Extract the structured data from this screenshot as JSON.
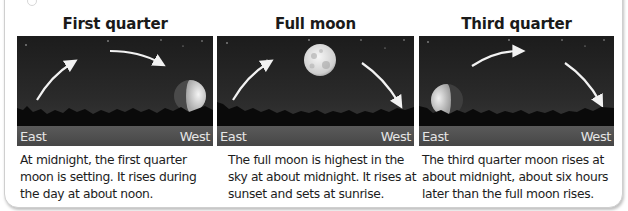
{
  "panels": [
    {
      "title": "First quarter",
      "east_label": "East",
      "west_label": "West",
      "moon_phase": "first-quarter",
      "moon_position": "setting-west",
      "caption": "At midnight, the first quarter moon is setting.  It rises during the day at about noon."
    },
    {
      "title": "Full moon",
      "east_label": "East",
      "west_label": "West",
      "moon_phase": "full",
      "moon_position": "highest-overhead",
      "caption": "The full moon is highest in the sky at about midnight.  It rises at sunset and sets at sunrise."
    },
    {
      "title": "Third quarter",
      "east_label": "East",
      "west_label": "West",
      "moon_phase": "third-quarter",
      "moon_position": "rising-east",
      "caption": "The third quarter moon rises at about midnight, about six hours later than the full moon rises."
    }
  ],
  "colors": {
    "sky_top": "#1c1c1c",
    "sky_horizon": "#3c3c3c",
    "trees": "#0a0a0a",
    "ground": "#4f4f4f",
    "arrow": "#f2f2f2",
    "moon_light": "#e8e8e8",
    "frame_border": "#cfcfcf"
  }
}
